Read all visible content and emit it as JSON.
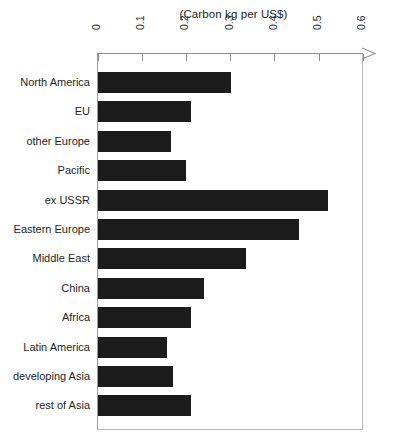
{
  "chart_data": {
    "type": "bar",
    "orientation": "horizontal",
    "title": "(Carbon kg per US$)",
    "xlabel": "",
    "ylabel": "",
    "xlim": [
      0,
      0.6
    ],
    "grid": false,
    "legend": null,
    "xticks": [
      "0",
      "0.1",
      "0.2",
      "0.3",
      "0.4",
      "0.5",
      "0.6"
    ],
    "xtick_values": [
      0,
      0.1,
      0.2,
      0.3,
      0.4,
      0.5,
      0.6
    ],
    "categories": [
      "North America",
      "EU",
      "other Europe",
      "Pacific",
      "ex USSR",
      "Eastern Europe",
      "Middle East",
      "China",
      "Africa",
      "Latin America",
      "developing Asia",
      "rest of Asia"
    ],
    "values": [
      0.3,
      0.21,
      0.165,
      0.2,
      0.52,
      0.455,
      0.335,
      0.24,
      0.21,
      0.155,
      0.17,
      0.21
    ],
    "bar_color": "#1c1c1c",
    "axis_color": "#8f8f8f"
  }
}
